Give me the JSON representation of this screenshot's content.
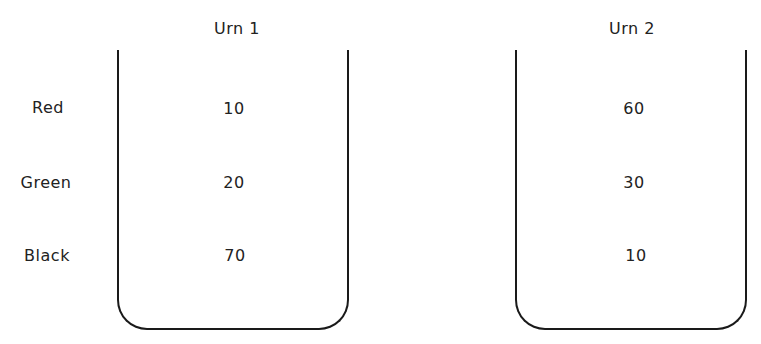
{
  "diagram": {
    "row_labels": [
      "Red",
      "Green",
      "Black"
    ],
    "urns": [
      {
        "title": "Urn 1",
        "counts": [
          "10",
          "20",
          "70"
        ]
      },
      {
        "title": "Urn 2",
        "counts": [
          "60",
          "30",
          "10"
        ]
      }
    ]
  }
}
